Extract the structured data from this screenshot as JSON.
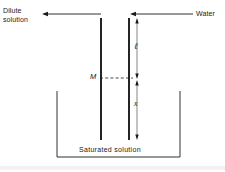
{
  "figure": {
    "title_alt": "Osmotic membrane diagram",
    "background_color": "#ffffff",
    "line_color": "#1a1a1a",
    "width": 225,
    "height": 172
  },
  "labels": {
    "dilute_solution": "Dilute\nsolution",
    "dilute_solution_line1": "Dilute",
    "dilute_solution_line2": "solution",
    "water": "Water",
    "membrane_m": "M",
    "length_ell": "ℓ",
    "depth_x": "x",
    "saturated_solution": "Saturated  solution"
  },
  "arrows": {
    "left_flow": {
      "name": "dilute-solution-flow-arrow",
      "direction": "left",
      "y": 14,
      "x_start": 101,
      "x_end": 42
    },
    "right_flow": {
      "name": "water-inflow-arrow",
      "direction": "left",
      "y": 14,
      "x_start": 193,
      "x_end": 130
    }
  },
  "membranes": [
    {
      "name": "left-membrane",
      "x": 101,
      "y_top": 18,
      "y_bottom": 140
    },
    {
      "name": "right-membrane",
      "x": 129,
      "y_top": 18,
      "y_bottom": 140
    }
  ],
  "dimensions": [
    {
      "name": "ell-dimension",
      "label": "ℓ",
      "x": 137,
      "y_top": 19,
      "y_bottom": 78
    },
    {
      "name": "x-dimension",
      "label": "x",
      "x": 137,
      "y_top": 80,
      "y_bottom": 139
    }
  ],
  "level_line": {
    "name": "m-level-dashed-line",
    "y": 78,
    "x_start": 101,
    "x_end": 132,
    "style": "dashed"
  },
  "vessel": {
    "name": "saturated-solution-vessel",
    "left": 57,
    "right": 180,
    "top": 91,
    "bottom": 157
  }
}
